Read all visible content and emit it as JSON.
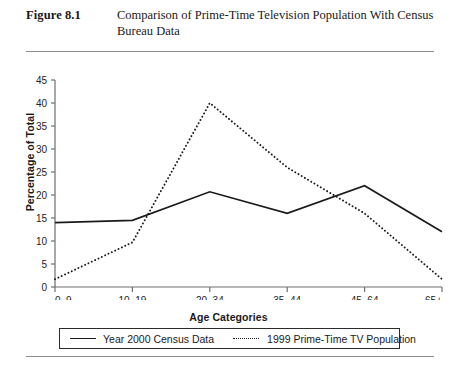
{
  "figure": {
    "label": "Figure 8.1",
    "caption": "Comparison of Prime-Time Television Population With Census Bureau Data"
  },
  "chart_data": {
    "type": "line",
    "title": "",
    "xlabel": "Age Categories",
    "ylabel": "Percentage of Total",
    "categories": [
      "0–9",
      "10–19",
      "20–34",
      "35–44",
      "45–64",
      "65+"
    ],
    "ylim": [
      0,
      45
    ],
    "yticks": [
      0,
      5,
      10,
      15,
      20,
      25,
      30,
      35,
      40,
      45
    ],
    "grid": false,
    "legend_position": "bottom",
    "series": [
      {
        "name": "Year 2000 Census Data",
        "style": "solid",
        "color": "#1a1a1a",
        "values": [
          14.0,
          14.5,
          20.7,
          16.0,
          22.0,
          12.0
        ]
      },
      {
        "name": "1999 Prime-Time TV Population",
        "style": "dotted",
        "color": "#1a1a1a",
        "values": [
          1.7,
          9.7,
          40.0,
          26.0,
          16.0,
          1.7
        ]
      }
    ]
  }
}
